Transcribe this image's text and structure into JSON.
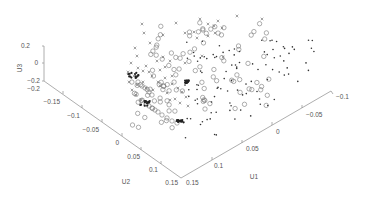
{
  "chart_data": {
    "type": "scatter",
    "projection": "3d",
    "title": "",
    "xlabel": "U1",
    "ylabel": "U2",
    "zlabel": "U3",
    "xlim": [
      -0.1,
      0.15
    ],
    "ylim": [
      -0.2,
      0.15
    ],
    "zlim": [
      -0.2,
      0.2
    ],
    "x_ticks": [
      "0.15",
      "0.1",
      "0.05",
      "0",
      "-0.05",
      "-0.1"
    ],
    "y_ticks": [
      "-0.2",
      "-0.15",
      "-0.1",
      "-0.05",
      "0",
      "0.05",
      "0.1",
      "0.15"
    ],
    "z_ticks": [
      "0.2",
      "0",
      "-0.2"
    ],
    "grid": false,
    "legend": null,
    "series": [
      {
        "name": "cross",
        "marker": "x",
        "color": "#666666",
        "count_approx": 60
      },
      {
        "name": "circle",
        "marker": "o",
        "color": "#777777",
        "count_approx": 110
      },
      {
        "name": "dot",
        "marker": ".",
        "color": "#333333",
        "count_approx": 130
      }
    ]
  },
  "axes": {
    "u3_label": "U3",
    "u2_label": "U2",
    "u1_label": "U1",
    "u3_ticks": [
      "0.2",
      "0",
      "−0.2"
    ],
    "u2_ticks": [
      "−0.2",
      "−0.15",
      "−0.1",
      "−0.05",
      "0",
      "0.05",
      "0.1",
      "0.15"
    ],
    "u1_ticks": [
      "0.15",
      "0.1",
      "0.05",
      "0",
      "−0.05",
      "−0.1"
    ]
  }
}
